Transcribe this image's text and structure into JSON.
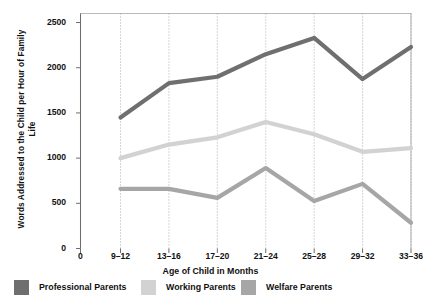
{
  "chart_data": {
    "type": "line",
    "title": "",
    "xlabel": "Age of Child in Months",
    "ylabel": "Words Addressed to the Child per Hour of Family Life",
    "categories": [
      "9–12",
      "13–16",
      "17–20",
      "21–24",
      "25–28",
      "29–32",
      "33–36"
    ],
    "xtick_labels": [
      "0",
      "9–12",
      "13–16",
      "17–20",
      "21–24",
      "25–28",
      "29–32",
      "33–36"
    ],
    "ytick_labels": [
      "0",
      "500",
      "1000",
      "1500",
      "2000",
      "2500"
    ],
    "ytick_values": [
      0,
      500,
      1000,
      1500,
      2000,
      2500
    ],
    "ylim": [
      0,
      2600
    ],
    "grid": "vertical-dotted",
    "legend_position": "below",
    "series": [
      {
        "name": "Professional Parents",
        "color": "#706f6f",
        "values": [
          1450,
          1830,
          1900,
          2150,
          2330,
          1875,
          2230
        ]
      },
      {
        "name": "Working Parents",
        "color": "#d2d2d2",
        "values": [
          1000,
          1150,
          1230,
          1400,
          1265,
          1070,
          1110
        ]
      },
      {
        "name": "Welfare Parents",
        "color": "#a6a6a6",
        "values": [
          660,
          660,
          560,
          890,
          525,
          715,
          285
        ]
      }
    ]
  },
  "legend": {
    "items": [
      {
        "label": "Professional Parents",
        "color": "#706f6f"
      },
      {
        "label": "Working Parents",
        "color": "#d2d2d2"
      },
      {
        "label": "Welfare Parents",
        "color": "#a6a6a6"
      }
    ]
  },
  "axes": {
    "y_title": "Words Addressed to the Child per Hour of Family Life",
    "x_title": "Age of Child in Months"
  }
}
